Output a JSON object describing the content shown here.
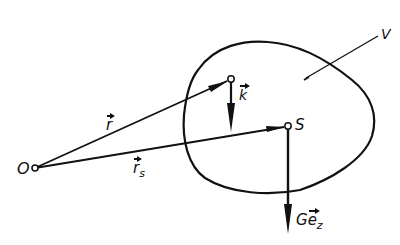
{
  "diagram": {
    "type": "vector-mechanics-sketch",
    "stroke_color": "#111111",
    "background": "#ffffff",
    "labels": {
      "origin": "O",
      "body_volume": "V",
      "point_vector": "r",
      "center_vector": "r",
      "center_vector_sub": "s",
      "unit_force": "k",
      "center": "S",
      "gravity_prefix": "G",
      "gravity_unit": "e",
      "gravity_sub": "z"
    },
    "points": {
      "O": [
        35,
        168
      ],
      "k_point": [
        231,
        79
      ],
      "S": [
        288,
        126
      ]
    },
    "vectors": [
      {
        "name": "r",
        "from": "O",
        "to": "k_point"
      },
      {
        "name": "r_s",
        "from": "O",
        "to": "S"
      },
      {
        "name": "k",
        "from": "k_point",
        "to": [
          231,
          132
        ]
      },
      {
        "name": "G e_z",
        "from": "S",
        "to": [
          288,
          234
        ]
      }
    ]
  }
}
